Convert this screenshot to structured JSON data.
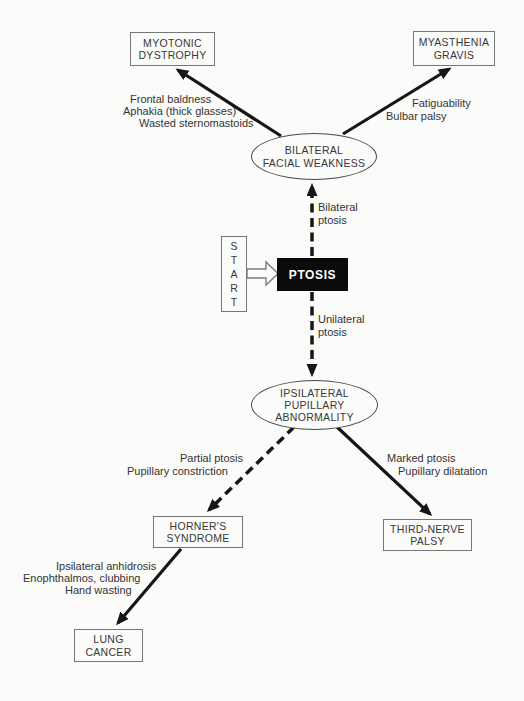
{
  "palette": {
    "paper": "#fbfbf9",
    "line_ink": "#161616",
    "text_ink": "#343434",
    "box_border": "#777777",
    "ptosis_fill": "#0b0b0b",
    "ptosis_text": "#ffffff"
  },
  "nodes": {
    "myotonic": {
      "label": "MYOTONIC\nDYSTROPHY"
    },
    "myasthenia": {
      "label": "MYASTHENIA\nGRAVIS"
    },
    "bilateral_facial_weakness": {
      "label": "BILATERAL\nFACIAL WEAKNESS"
    },
    "start": {
      "label": "S\nT\nA\nR\nT"
    },
    "ptosis": {
      "label": "PTOSIS"
    },
    "ipsilateral_pupillary_abnormality": {
      "label": "IPSILATERAL\nPUPILLARY\nABNORMALITY"
    },
    "horners_syndrome": {
      "label": "HORNER'S\nSYNDROME"
    },
    "third_nerve_palsy": {
      "label": "THIRD-NERVE\nPALSY"
    },
    "lung_cancer": {
      "label": "LUNG\nCANCER"
    }
  },
  "edge_labels": {
    "to_myotonic": [
      "Frontal baldness",
      "Aphakia (thick glasses)",
      "Wasted sternomastoids"
    ],
    "to_myasthenia": [
      "Fatiguability",
      "Bulbar palsy"
    ],
    "bilateral_ptosis": [
      "Bilateral",
      "ptosis"
    ],
    "unilateral_ptosis": [
      "Unilateral",
      "ptosis"
    ],
    "to_horners": [
      "Partial ptosis",
      "Pupillary constriction"
    ],
    "to_third_nerve": [
      "Marked ptosis",
      "Pupillary dilatation"
    ],
    "to_lung_cancer": [
      "Ipsilateral anhidrosis",
      "Enophthalmos, clubbing",
      "Hand wasting"
    ]
  }
}
